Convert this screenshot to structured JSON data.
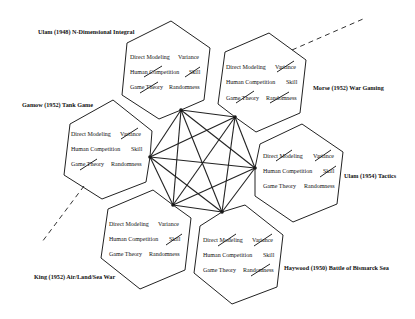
{
  "diagram": {
    "attribute_labels": [
      "Direct Modeling",
      "Variance",
      "Human Competition",
      "Skill",
      "Game Theory",
      "Randomness"
    ],
    "hexagons": [
      {
        "id": "ulam-1948",
        "title": "Ulam (1948) N-Dimensional Integral",
        "attributes": {
          "direct_modeling": "Direct Modeling",
          "variance": "Variance",
          "human_competition": "Human Competition",
          "skill": "Skill",
          "game_theory": "Game Theory",
          "randomness": "Randomness"
        },
        "struck": [
          "Human Competition",
          "Skill",
          "Game Theory"
        ]
      },
      {
        "id": "morse-1952",
        "title": "Morse (1952) War Gaming",
        "attributes": {
          "direct_modeling": "Direct Modeling",
          "variance": "Variance",
          "human_competition": "Human Competition",
          "skill": "Skill",
          "game_theory": "Game Theory",
          "randomness": "Randomness"
        },
        "struck": [
          "Variance",
          "Game Theory",
          "Randomness"
        ]
      },
      {
        "id": "gamow-1952",
        "title": "Gamow (1952) Tank Game",
        "attributes": {
          "direct_modeling": "Direct Modeling",
          "variance": "Variance",
          "human_competition": "Human Competition",
          "skill": "Skill",
          "game_theory": "Game Theory",
          "randomness": "Randomness"
        },
        "struck": [
          "Variance",
          "Game Theory"
        ]
      },
      {
        "id": "ulam-1954",
        "title": "Ulam (1954) Tactics",
        "attributes": {
          "direct_modeling": "Direct Modeling",
          "variance": "Variance",
          "human_competition": "Human Competition",
          "skill": "Skill",
          "game_theory": "Game Theory",
          "randomness": "Randomness"
        },
        "struck": [
          "Direct Modeling",
          "Variance",
          "Skill"
        ]
      },
      {
        "id": "king-1952",
        "title": "King (1952) Air/Land/Sea War",
        "attributes": {
          "direct_modeling": "Direct Modeling",
          "variance": "Variance",
          "human_competition": "Human Competition",
          "skill": "Skill",
          "game_theory": "Game Theory",
          "randomness": "Randomness"
        },
        "struck": [
          "Skill"
        ]
      },
      {
        "id": "haywood-1950",
        "title": "Haywood (1950) Battle of Bismarck Sea",
        "attributes": {
          "direct_modeling": "Direct Modeling",
          "variance": "Variance",
          "human_competition": "Human Competition",
          "skill": "Skill",
          "game_theory": "Game Theory",
          "randomness": "Randomness"
        },
        "struck": [
          "Direct Modeling",
          "Variance",
          "Randomness"
        ]
      }
    ],
    "central_graph": {
      "type": "complete-graph",
      "node_count": 6
    }
  }
}
